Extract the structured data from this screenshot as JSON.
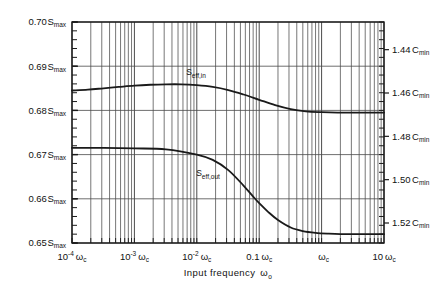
{
  "chart_data": {
    "type": "line",
    "title": "",
    "xlabel": "Input frequency ωₒ",
    "ylabel_left": "",
    "ylabel_right": "",
    "xscale": "log",
    "xlim": [
      0.0001,
      10
    ],
    "grid": true,
    "legend": "inline-labels",
    "x_ticks": [
      {
        "value": 0.0001,
        "label": "10",
        "exp": "-4",
        "unit": "ωc"
      },
      {
        "value": 0.001,
        "label": "10",
        "exp": "-3",
        "unit": "ωc"
      },
      {
        "value": 0.01,
        "label": "10",
        "exp": "-2",
        "unit": "ωc"
      },
      {
        "value": 0.1,
        "label": "0.1",
        "exp": "",
        "unit": "ωc"
      },
      {
        "value": 1,
        "label": "",
        "exp": "",
        "unit": "ωc"
      },
      {
        "value": 10,
        "label": "10",
        "exp": "",
        "unit": "ωc"
      }
    ],
    "y_left": {
      "unit": "S max",
      "lim": [
        0.65,
        0.7
      ],
      "ticks": [
        "0.70",
        "0.69",
        "0.68",
        "0.67",
        "0.66",
        "0.65"
      ],
      "tick_values": [
        0.7,
        0.69,
        0.68,
        0.67,
        0.66,
        0.65
      ],
      "minor_per_division": 5
    },
    "y_right": {
      "unit": "C min",
      "ticks": [
        "1.44",
        "1.46",
        "1.48",
        "1.50",
        "1.52"
      ],
      "tick_values": [
        1.44,
        1.46,
        1.48,
        1.5,
        1.52
      ],
      "minor_per_division": 5
    },
    "series": [
      {
        "name": "S eff,in",
        "label_base": "S",
        "label_sub": "eff,in",
        "color": "#1a1a1a",
        "points_x": [
          0.0001,
          0.00018,
          0.00032,
          0.00056,
          0.001,
          0.0018,
          0.0032,
          0.0056,
          0.01,
          0.018,
          0.032,
          0.056,
          0.1,
          0.18,
          0.32,
          0.56,
          1.0,
          1.8,
          3.2,
          5.6,
          10.0
        ],
        "points_y": [
          0.6845,
          0.6847,
          0.685,
          0.6853,
          0.6856,
          0.6858,
          0.6859,
          0.6859,
          0.6857,
          0.6853,
          0.6846,
          0.6836,
          0.6824,
          0.6812,
          0.6803,
          0.6798,
          0.6796,
          0.6795,
          0.6795,
          0.6795,
          0.6795
        ]
      },
      {
        "name": "S eff,out",
        "label_base": "S",
        "label_sub": "eff,out",
        "color": "#1a1a1a",
        "points_x": [
          0.0001,
          0.00032,
          0.001,
          0.0032,
          0.01,
          0.018,
          0.032,
          0.056,
          0.08,
          0.1,
          0.14,
          0.2,
          0.32,
          0.5,
          0.8,
          1.3,
          2.0,
          3.2,
          5.6,
          10.0
        ],
        "points_y": [
          0.6715,
          0.6715,
          0.6714,
          0.6712,
          0.67,
          0.6688,
          0.6665,
          0.663,
          0.6605,
          0.659,
          0.657,
          0.6552,
          0.6535,
          0.6527,
          0.6523,
          0.6521,
          0.652,
          0.652,
          0.652,
          0.652
        ]
      }
    ],
    "annotations": [
      {
        "name": "s-eff-in-label",
        "text": "S eff,in",
        "x_px": 196,
        "y_px": 75
      },
      {
        "name": "s-eff-out-label",
        "text": "S eff,out",
        "x_px": 208,
        "y_px": 176
      }
    ]
  },
  "axis": {
    "x_title": "Input  frequency",
    "x_title_sym": "ω",
    "x_title_sub": "o"
  }
}
